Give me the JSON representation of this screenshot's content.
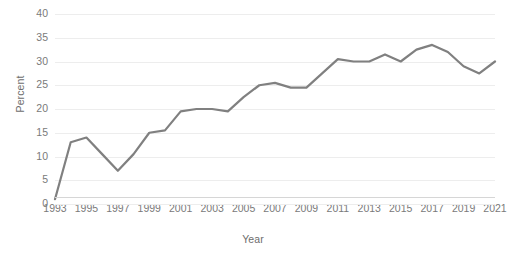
{
  "chart_data": {
    "type": "line",
    "title": "",
    "xlabel": "Year",
    "ylabel": "Percent",
    "grid": true,
    "legend": "none",
    "line_color": "#808080",
    "grid_color": "#ededed",
    "tick_color": "#7a7a7a",
    "xlim": [
      1993,
      2021
    ],
    "ylim": [
      0,
      40
    ],
    "yticks": [
      0,
      5,
      10,
      15,
      20,
      25,
      30,
      35,
      40
    ],
    "xticks": [
      1993,
      1995,
      1997,
      1999,
      2001,
      2003,
      2005,
      2007,
      2009,
      2011,
      2013,
      2015,
      2017,
      2019,
      2021
    ],
    "x": [
      1993,
      1994,
      1995,
      1996,
      1997,
      1998,
      1999,
      2000,
      2001,
      2002,
      2003,
      2004,
      2005,
      2006,
      2007,
      2008,
      2009,
      2010,
      2011,
      2012,
      2013,
      2014,
      2015,
      2016,
      2017,
      2018,
      2019,
      2020,
      2021
    ],
    "values": [
      1,
      13,
      14,
      10.5,
      7,
      10.5,
      15,
      15.5,
      19.5,
      20,
      20,
      19.5,
      22.5,
      25,
      25.5,
      24.5,
      24.5,
      27.5,
      30.5,
      30,
      30,
      31.5,
      30,
      32.5,
      33.5,
      32,
      29,
      27.5,
      30
    ]
  },
  "axis": {
    "y_title": "Percent",
    "x_title": "Year",
    "y_tick_labels": [
      "40",
      "35",
      "30",
      "25",
      "20",
      "15",
      "10",
      "5",
      "0"
    ],
    "x_tick_labels": [
      "1993",
      "1995",
      "1997",
      "1999",
      "2001",
      "2003",
      "2005",
      "2007",
      "2009",
      "2011",
      "2013",
      "2015",
      "2017",
      "2019",
      "2021"
    ]
  }
}
